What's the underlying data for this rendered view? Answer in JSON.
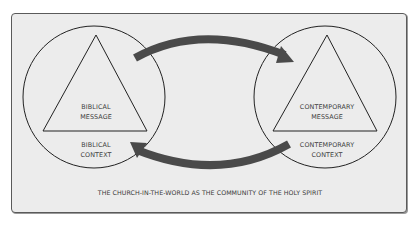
{
  "diagram": {
    "left": {
      "message_line1": "BIBLICAL",
      "message_line2": "MESSAGE",
      "context_line1": "BIBLICAL",
      "context_line2": "CONTEXT"
    },
    "right": {
      "message_line1": "CONTEMPORARY",
      "message_line2": "MESSAGE",
      "context_line1": "CONTEMPORARY",
      "context_line2": "CONTEXT"
    },
    "arrows": {
      "top": "left-to-right",
      "bottom": "right-to-left",
      "color": "#4a4a4a"
    },
    "caption": "THE CHURCH-IN-THE-WORLD AS THE COMMUNITY OF THE HOLY SPIRIT",
    "colors": {
      "background": "#ececec",
      "stroke": "#222222",
      "text": "#3c3c3c"
    }
  }
}
